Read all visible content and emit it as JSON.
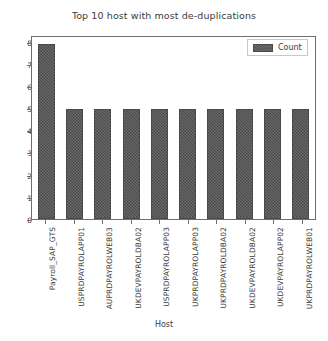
{
  "chart_data": {
    "type": "bar",
    "title": "Top 10 host with most de-duplications",
    "xlabel": "Host",
    "ylabel": "",
    "categories": [
      "Payroll_SAP_GTS",
      "USPRDPAYROLAPP01",
      "AUPRDPAYROLWEB03",
      "UKDEVPAYROLDBA02",
      "USPRDPAYROLAPP03",
      "UKPRDPAYROLAPP03",
      "UKPRDPAYROLDBA02",
      "UKDEVPAYROLDBA02",
      "UKDEVPAYROLAPP02",
      "UKPRDPAYROLWEB01"
    ],
    "values": [
      8,
      5,
      5,
      5,
      5,
      5,
      5,
      5,
      5,
      5
    ],
    "series": [
      {
        "name": "Count",
        "values": [
          8,
          5,
          5,
          5,
          5,
          5,
          5,
          5,
          5,
          5
        ]
      }
    ],
    "ylim": [
      0,
      8.3
    ],
    "yticks": [
      0,
      1,
      2,
      3,
      4,
      5,
      6,
      7,
      8
    ],
    "ytick_labels": [
      "0",
      "1",
      "2",
      "3",
      "4",
      "5",
      "6",
      "7",
      "8"
    ],
    "grid": false,
    "legend": {
      "position": "upper-right",
      "entries": [
        "Count"
      ]
    },
    "bar_color": "#555555",
    "bar_edge_color": "#4a4a4a",
    "hatch": "cross-hatch"
  }
}
